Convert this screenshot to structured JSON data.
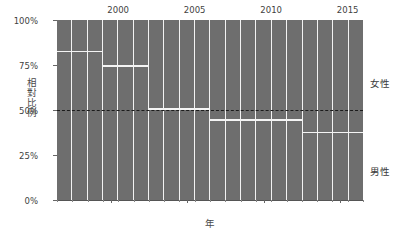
{
  "chart_data": {
    "type": "bar",
    "title": "",
    "subtitle": "",
    "xlabel": "年",
    "ylabel": "相對比例",
    "categories": [
      1997,
      1998,
      1999,
      2000,
      2001,
      2002,
      2003,
      2004,
      2005,
      2006,
      2007,
      2008,
      2009,
      2010,
      2011,
      2012,
      2013,
      2014,
      2015,
      2016
    ],
    "x": [
      1997,
      1998,
      1999,
      2000,
      2001,
      2002,
      2003,
      2004,
      2005,
      2006,
      2007,
      2008,
      2009,
      2010,
      2011,
      2012,
      2013,
      2014,
      2015,
      2016
    ],
    "series": [
      {
        "name": "女性",
        "values": [
          83,
          83,
          83,
          75,
          75,
          75,
          51,
          51,
          51,
          51,
          45,
          45,
          45,
          45,
          45,
          45,
          38,
          38,
          38,
          38
        ]
      },
      {
        "name": "男性",
        "values": [
          17,
          17,
          17,
          25,
          25,
          25,
          49,
          49,
          49,
          49,
          55,
          55,
          55,
          55,
          55,
          55,
          62,
          62,
          62,
          62
        ]
      }
    ],
    "stacked": true,
    "bar_fill_color": "#6e6e6e",
    "divider_color": "#f4f4f4",
    "reference_line": {
      "value": 50,
      "style": "dashed",
      "color": "#1b1b1b"
    },
    "xlim": [
      1996.5,
      2016.5
    ],
    "ylim": [
      0,
      100
    ],
    "grid": false,
    "legend_position": "right",
    "yticks": [
      {
        "value": 0,
        "label": "0%"
      },
      {
        "value": 25,
        "label": "25%"
      },
      {
        "value": 50,
        "label": "50%"
      },
      {
        "value": 75,
        "label": "75%"
      },
      {
        "value": 100,
        "label": "100%"
      }
    ],
    "xticks": [
      {
        "value": 2000,
        "label": "2000"
      },
      {
        "value": 2005,
        "label": "2005"
      },
      {
        "value": 2010,
        "label": "2010"
      },
      {
        "value": 2015,
        "label": "2015"
      }
    ],
    "legend": [
      {
        "label": "女性",
        "position": "upper-right"
      },
      {
        "label": "男性",
        "position": "lower-right"
      }
    ]
  }
}
